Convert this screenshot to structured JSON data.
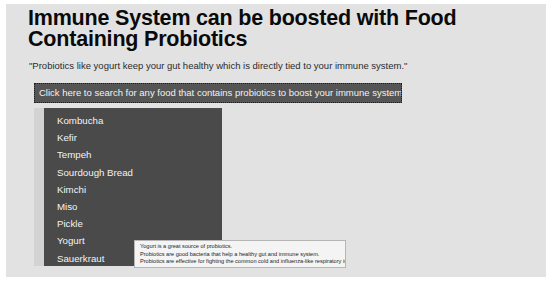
{
  "page": {
    "title": "Immune System can be boosted with Food Containing Probiotics",
    "subtitle": "\"Probiotics like yogurt keep your gut healthy which is directly tied to your immune system.\"",
    "background_color": "#e2e2e2",
    "frame_color": "#ffffff"
  },
  "search_button": {
    "label": "Click here to search for any food that contains probiotics to boost your immune system",
    "background_color": "#555555",
    "text_color": "#f2f2f2",
    "border_style": "dotted"
  },
  "dropdown": {
    "background_color": "#4a4a4a",
    "text_color": "#f3f3f3",
    "gutter_color": "#d3d3d3",
    "items": [
      {
        "label": "Kombucha"
      },
      {
        "label": "Kefir"
      },
      {
        "label": "Tempeh"
      },
      {
        "label": "Sourdough Bread"
      },
      {
        "label": "Kimchi"
      },
      {
        "label": "Miso"
      },
      {
        "label": "Pickle"
      },
      {
        "label": "Yogurt"
      },
      {
        "label": "Sauerkraut"
      }
    ]
  },
  "tooltip": {
    "background_color": "#f4f4f4",
    "border_color": "#b6b6b6",
    "lines": [
      "Yogurt is a great source of probiotics.",
      "Probiotics are good bacteria that help a healthy gut and immune system.",
      "Probiotics are effective for fighting the common cold and influenza-like respiratory infections."
    ]
  }
}
